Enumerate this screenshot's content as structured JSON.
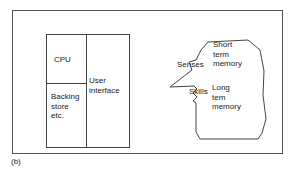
{
  "figure": {
    "caption": "(b)",
    "frame_color": "#555555",
    "line_color": "#444444",
    "background": "#ffffff",
    "text_color": "#1a1a1a"
  },
  "computer": {
    "name": "computer-block-diagram",
    "cells": {
      "cpu": "CPU",
      "backing_store": "Backing\nstore\netc.",
      "user_interface": "User\ninterface"
    }
  },
  "head": {
    "name": "human-head-diagram",
    "labels": {
      "senses": "Senses",
      "skills": "Skills",
      "short_term_memory": "Short\nterm\nmemory",
      "long_term_memory": "Long\ntem\nmemory"
    }
  }
}
